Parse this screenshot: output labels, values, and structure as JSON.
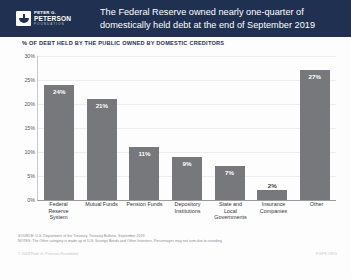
{
  "header": {
    "logo": {
      "line1": "PETER G.",
      "line2": "PETERSON",
      "line3": "FOUNDATION",
      "icon": "peterson-bowl-logo-icon"
    },
    "title_line1": "The Federal Reserve owned nearly one-quarter of",
    "title_line2": "domestically held debt at the end of September 2019",
    "background_color": "#1f3050"
  },
  "subtitle": "% OF DEBT HELD BY THE PUBLIC OWNED BY DOMESTIC CREDITORS",
  "footnotes": {
    "source": "SOURCE: U.S. Department of the Treasury, Treasury Bulletin, September 2019.",
    "notes": "NOTES: The Other category is made up of U.S. Savings Bonds and Other Investors. Percentages may not sum due to rounding.",
    "copyright": "© 2019 Peter G. Peterson Foundation",
    "url": "PGPF.ORG"
  },
  "chart_data": {
    "type": "bar",
    "title": "The Federal Reserve owned nearly one-quarter of domestically held debt at the end of September 2019",
    "subtitle": "% OF DEBT HELD BY THE PUBLIC OWNED BY DOMESTIC CREDITORS",
    "xlabel": "",
    "ylabel": "",
    "ylim": [
      0,
      30
    ],
    "ytick_values": [
      30,
      25,
      20,
      15,
      10,
      5,
      0
    ],
    "ytick_labels": [
      "30%",
      "25%",
      "20%",
      "15%",
      "10%",
      "5%",
      "0%"
    ],
    "grid": true,
    "legend": false,
    "bar_color": "#77787b",
    "categories": [
      "Federal Reserve System",
      "Mutual Funds",
      "Pension Funds",
      "Depository Institutions",
      "State and Local Governments",
      "Insurance Companies",
      "Other"
    ],
    "category_lines": [
      [
        "Federal",
        "Reserve",
        "System"
      ],
      [
        "Mutual Funds"
      ],
      [
        "Pension Funds"
      ],
      [
        "Depository",
        "Institutions"
      ],
      [
        "State and",
        "Local",
        "Governments"
      ],
      [
        "Insurance",
        "Companies"
      ],
      [
        "Other"
      ]
    ],
    "values": [
      24,
      21,
      11,
      9,
      7,
      2,
      27
    ],
    "value_labels": [
      "24%",
      "21%",
      "11%",
      "9%",
      "7%",
      "2%",
      "27%"
    ],
    "label_placement": [
      "inside",
      "inside",
      "inside",
      "inside",
      "inside",
      "outside",
      "inside"
    ]
  }
}
